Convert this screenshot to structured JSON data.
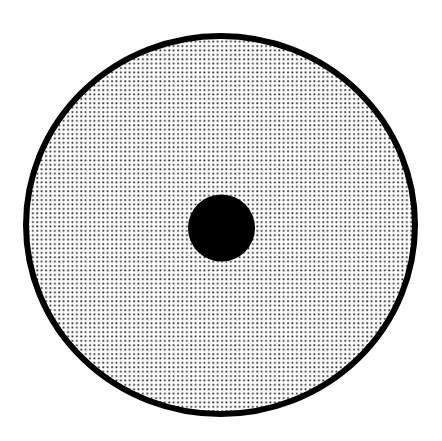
{
  "figure": {
    "background_color": "#ffffff",
    "outer_disc": {
      "cx": 220.5,
      "cy": 225,
      "rx": 194.5,
      "ry": 189,
      "stroke_color": "#000000",
      "stroke_width": 6,
      "fill": "stipple-pattern"
    },
    "stipple": {
      "grid": "square",
      "spacing": 4.4,
      "dot_size": 1.7,
      "dot_color": "#161616",
      "background": "#ffffff"
    },
    "center_dot": {
      "cx": 221.5,
      "cy": 228,
      "r": 33.5,
      "color": "#000000"
    }
  }
}
